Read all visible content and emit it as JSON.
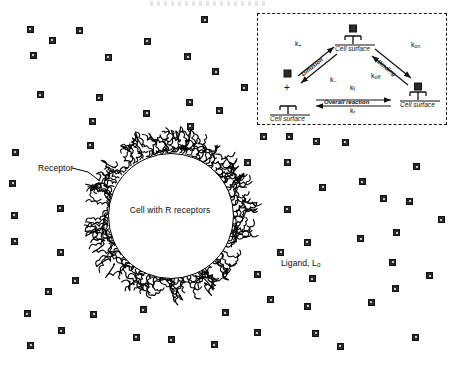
{
  "figure": {
    "type": "cell-receptor-ligand-binding-schematic",
    "main": {
      "cell_caption": "Cell with R receptors",
      "receptor_label": "Receptor",
      "ligand_label": "Ligand, L",
      "ligand_label_sub": "0",
      "ligand_count": 64,
      "cell": {
        "cx": 170,
        "cy": 215,
        "r": 62,
        "fill": "#ffffff",
        "stroke": "#000000"
      }
    },
    "inset": {
      "border_style": "dashed",
      "nodes": {
        "free_ligand_plus_receptor": {
          "surface_label": "Cell surface",
          "plus_sign": "+"
        },
        "encounter_complex": {
          "surface_label": "Cell surface"
        },
        "bound_complex": {
          "surface_label": "Cell surface"
        }
      },
      "steps": [
        {
          "name": "diffusion",
          "label": "Diffusion",
          "rate_forward": "k",
          "rate_forward_sub": "+",
          "rate_reverse": "k",
          "rate_reverse_sub": "−"
        },
        {
          "name": "binding",
          "label": "Binding",
          "rate_forward": "k",
          "rate_forward_sub": "on",
          "rate_reverse": "k",
          "rate_reverse_sub": "off"
        },
        {
          "name": "overall-reaction",
          "label": "Overall reaction",
          "rate_forward": "k",
          "rate_forward_sub": "f",
          "rate_reverse": "k",
          "rate_reverse_sub": "r"
        }
      ]
    },
    "colors": {
      "ink": "#111111",
      "ligand_fill": "#2a2a2a",
      "background": "#ffffff"
    }
  }
}
